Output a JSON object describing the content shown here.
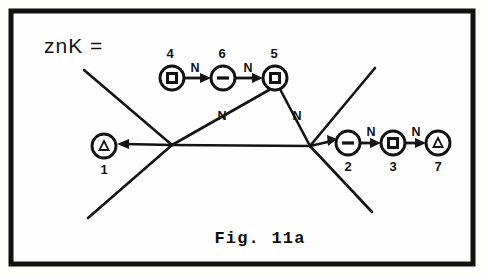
{
  "figure": {
    "caption": "Fig. 11a",
    "expression": "znK =",
    "border_color": "#111111",
    "ink_color": "#141414",
    "background_color": "#fefefe"
  },
  "nodes": [
    {
      "id": "1",
      "label": "1",
      "glyph": "triangle",
      "cx": 104,
      "cy": 146,
      "r": 12,
      "label_x": 104,
      "label_y": 174
    },
    {
      "id": "2",
      "label": "2",
      "glyph": "minus",
      "cx": 348,
      "cy": 143,
      "r": 12,
      "label_x": 348,
      "label_y": 171
    },
    {
      "id": "3",
      "label": "3",
      "glyph": "square",
      "cx": 393,
      "cy": 143,
      "r": 12,
      "label_x": 393,
      "label_y": 171
    },
    {
      "id": "4",
      "label": "4",
      "glyph": "square",
      "cx": 172,
      "cy": 78,
      "r": 12,
      "label_x": 170,
      "label_y": 58
    },
    {
      "id": "5",
      "label": "5",
      "glyph": "square",
      "cx": 275,
      "cy": 78,
      "r": 12,
      "label_x": 274,
      "label_y": 58
    },
    {
      "id": "6",
      "label": "6",
      "glyph": "minus",
      "cx": 223,
      "cy": 78,
      "r": 12,
      "label_x": 222,
      "label_y": 58
    },
    {
      "id": "7",
      "label": "7",
      "glyph": "triangle",
      "cx": 438,
      "cy": 143,
      "r": 12,
      "label_x": 438,
      "label_y": 171
    }
  ],
  "edge_labels": [
    {
      "text": "N",
      "x": 195,
      "y": 72
    },
    {
      "text": "N",
      "x": 248,
      "y": 72
    },
    {
      "text": "N",
      "x": 222,
      "y": 120
    },
    {
      "text": "N",
      "x": 297,
      "y": 120
    },
    {
      "text": "N",
      "x": 371,
      "y": 136
    },
    {
      "text": "N",
      "x": 416,
      "y": 136
    }
  ],
  "chain_edges": [
    {
      "name": "edge-4-to-6",
      "x1": 185,
      "y1": 78,
      "x2": 209,
      "y2": 78
    },
    {
      "name": "edge-6-to-5",
      "x1": 236,
      "y1": 78,
      "x2": 261,
      "y2": 78
    },
    {
      "name": "edge-2-to-3",
      "x1": 361,
      "y1": 143,
      "x2": 379,
      "y2": 143
    },
    {
      "name": "edge-3-to-7",
      "x1": 406,
      "y1": 143,
      "x2": 424,
      "y2": 143
    }
  ],
  "tree_edges": [
    {
      "name": "junction-left-to-node1",
      "x1": 172,
      "y1": 145,
      "x2": 120,
      "y2": 144
    },
    {
      "name": "junction-left-to-node5",
      "x1": 172,
      "y1": 145,
      "x2": 268,
      "y2": 90
    },
    {
      "name": "junction-left-to-right",
      "x1": 172,
      "y1": 145,
      "x2": 310,
      "y2": 146
    },
    {
      "name": "junction-right-to-node5",
      "x1": 310,
      "y1": 146,
      "x2": 281,
      "y2": 90
    },
    {
      "name": "junction-right-to-node2",
      "x1": 310,
      "y1": 146,
      "x2": 333,
      "y2": 140
    },
    {
      "name": "free-branch-upper-left",
      "x1": 172,
      "y1": 145,
      "x2": 84,
      "y2": 70
    },
    {
      "name": "free-branch-lower-left",
      "x1": 172,
      "y1": 145,
      "x2": 88,
      "y2": 218
    },
    {
      "name": "free-branch-upper-right",
      "x1": 310,
      "y1": 146,
      "x2": 375,
      "y2": 68
    },
    {
      "name": "free-branch-lower-right",
      "x1": 310,
      "y1": 146,
      "x2": 372,
      "y2": 212
    }
  ],
  "frame": {
    "x": 11,
    "y": 11,
    "width": 462,
    "height": 253
  },
  "expression_position": {
    "x": 44,
    "y": 53
  },
  "caption_position": {
    "x": 260,
    "y": 243
  }
}
